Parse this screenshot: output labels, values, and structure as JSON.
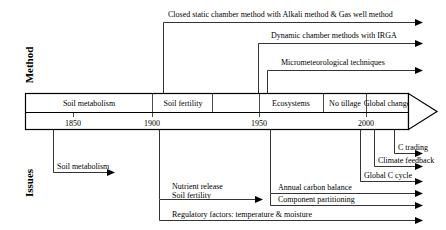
{
  "figure": {
    "title": "",
    "background": "#ffffff",
    "line_color": "#000000",
    "width": 446,
    "height": 230
  },
  "axes": {
    "top_label": "Method",
    "bottom_label": "Issues"
  },
  "timeline": {
    "year_ticks": [
      "1850",
      "1900",
      "1950",
      "2000"
    ],
    "era_cells": [
      {
        "label": "Soil metabolism"
      },
      {
        "label": "Soil fertility"
      },
      {
        "label": ""
      },
      {
        "label": "Ecosystems"
      },
      {
        "label": "No tillage"
      },
      {
        "label": "Global change"
      }
    ],
    "arrowhead": "right-arrow-icon"
  },
  "methods": [
    {
      "label": "Closed static chamber method with Alkali method & Gas well method"
    },
    {
      "label": "Dynamic chamber methods with IRGA"
    },
    {
      "label": "Micrometeorological techniques"
    }
  ],
  "issues": [
    {
      "label": "Soil metabolism"
    },
    {
      "label": "C trading"
    },
    {
      "label": "Climate feedback"
    },
    {
      "label": "Global C cycle"
    },
    {
      "label": "Nutrient release"
    },
    {
      "label": "Annual carbon balance"
    },
    {
      "label": "Soil fertility"
    },
    {
      "label": "Component partitioning"
    },
    {
      "label": "Regulatory factors: temperature & moisture"
    }
  ]
}
